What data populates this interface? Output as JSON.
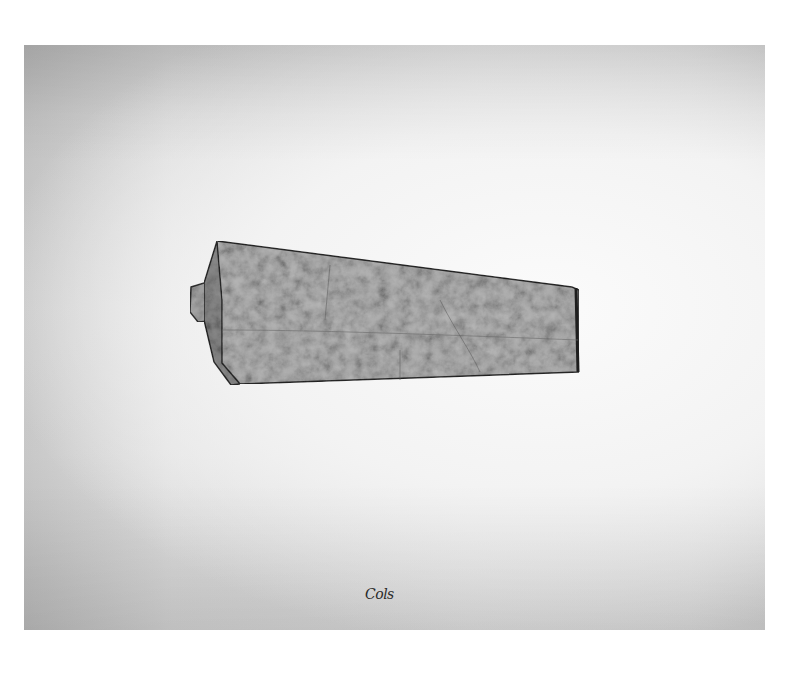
{
  "image": {
    "description": "Photograph of a folded, wedge-shaped textured paper/metal sculpture on a white-gray sheet",
    "background_color": "#ffffff",
    "paper_color": "#eeeeee",
    "object_fill": "#9a9a9a",
    "object_edge": "#2b2b2b"
  },
  "signature": {
    "text": "Cols"
  }
}
